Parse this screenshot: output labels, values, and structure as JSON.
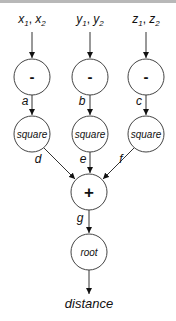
{
  "diagram": {
    "inputs": [
      {
        "id": "in-x",
        "label": "x₁, x₂",
        "base": "x",
        "sub1": "1",
        "sub2": "2"
      },
      {
        "id": "in-y",
        "label": "y₁, y₂",
        "base": "y",
        "sub1": "1",
        "sub2": "2"
      },
      {
        "id": "in-z",
        "label": "z₁, z₂",
        "base": "z",
        "sub1": "1",
        "sub2": "2"
      }
    ],
    "nodes": [
      {
        "id": "sub-x",
        "label": "-",
        "type": "operator"
      },
      {
        "id": "sub-y",
        "label": "-",
        "type": "operator"
      },
      {
        "id": "sub-z",
        "label": "-",
        "type": "operator"
      },
      {
        "id": "sq-x",
        "label": "square",
        "type": "function"
      },
      {
        "id": "sq-y",
        "label": "square",
        "type": "function"
      },
      {
        "id": "sq-z",
        "label": "square",
        "type": "function"
      },
      {
        "id": "sum",
        "label": "+",
        "type": "operator"
      },
      {
        "id": "root",
        "label": "root",
        "type": "function"
      }
    ],
    "edges": [
      {
        "from": "in-x",
        "to": "sub-x",
        "label": ""
      },
      {
        "from": "in-y",
        "to": "sub-y",
        "label": ""
      },
      {
        "from": "in-z",
        "to": "sub-z",
        "label": ""
      },
      {
        "from": "sub-x",
        "to": "sq-x",
        "label": "a"
      },
      {
        "from": "sub-y",
        "to": "sq-y",
        "label": "b"
      },
      {
        "from": "sub-z",
        "to": "sq-z",
        "label": "c"
      },
      {
        "from": "sq-x",
        "to": "sum",
        "label": "d"
      },
      {
        "from": "sq-y",
        "to": "sum",
        "label": "e"
      },
      {
        "from": "sq-z",
        "to": "sum",
        "label": "f"
      },
      {
        "from": "sum",
        "to": "root",
        "label": "g"
      },
      {
        "from": "root",
        "to": "output",
        "label": ""
      }
    ],
    "output": {
      "label": "distance"
    },
    "colors": {
      "stroke": "#333333",
      "text": "#111111",
      "background": "#ffffff"
    }
  }
}
